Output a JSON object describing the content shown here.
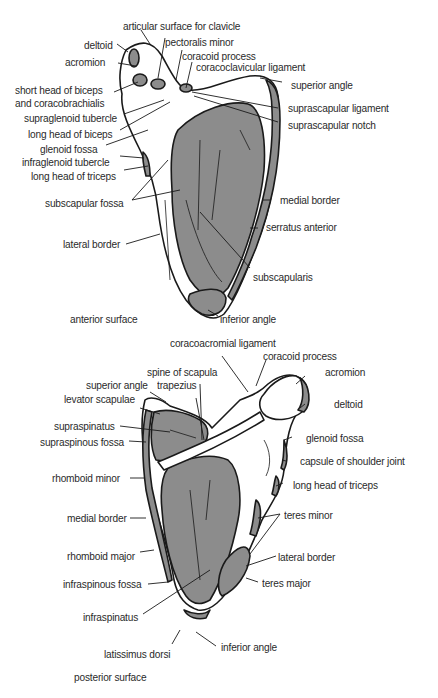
{
  "colors": {
    "muscle": "#8c8c8c",
    "bone": "#ffffff",
    "outline": "#1a1a1a",
    "text": "#2a2a2a"
  },
  "anterior": {
    "caption": "anterior surface",
    "labels": {
      "articular_surface": "articular surface for clavicle",
      "deltoid": "deltoid",
      "pectoralis_minor": "pectoralis minor",
      "acromion": "acromion",
      "coracoid_process": "coracoid process",
      "coracoclavicular_ligament": "coracoclavicular ligament",
      "superior_angle": "superior angle",
      "short_head_biceps_1": "short head of biceps",
      "short_head_biceps_2": "and coracobrachialis",
      "suprascapular_ligament": "suprascapular ligament",
      "supraglenoid_tubercle": "supraglenoid tubercle",
      "suprascapular_notch": "suprascapular notch",
      "long_head_biceps": "long head of biceps",
      "glenoid_fossa": "glenoid fossa",
      "infraglenoid_tubercle": "infraglenoid tubercle",
      "long_head_triceps": "long head of triceps",
      "medial_border": "medial border",
      "subscapular_fossa": "subscapular fossa",
      "serratus_anterior": "serratus anterior",
      "lateral_border": "lateral border",
      "subscapularis": "subscapularis",
      "inferior_angle": "inferior angle"
    }
  },
  "posterior": {
    "caption": "posterior surface",
    "labels": {
      "coracoacromial_ligament": "coracoacromial ligament",
      "coracoid_process": "coracoid process",
      "spine_of_scapula": "spine of scapula",
      "acromion": "acromion",
      "superior_angle": "superior angle",
      "trapezius": "trapezius",
      "levator_scapulae": "levator scapulae",
      "deltoid": "deltoid",
      "supraspinatus": "supraspinatus",
      "supraspinous_fossa": "supraspinous fossa",
      "glenoid_fossa": "glenoid fossa",
      "capsule": "capsule of shoulder joint",
      "rhomboid_minor": "rhomboid minor",
      "long_head_triceps": "long head of triceps",
      "medial_border": "medial border",
      "teres_minor": "teres minor",
      "rhomboid_major": "rhomboid major",
      "lateral_border": "lateral border",
      "infraspinous_fossa": "infraspinous fossa",
      "teres_major": "teres major",
      "infraspinatus": "infraspinatus",
      "inferior_angle": "inferior angle",
      "latissimus_dorsi": "latissimus dorsi"
    }
  }
}
